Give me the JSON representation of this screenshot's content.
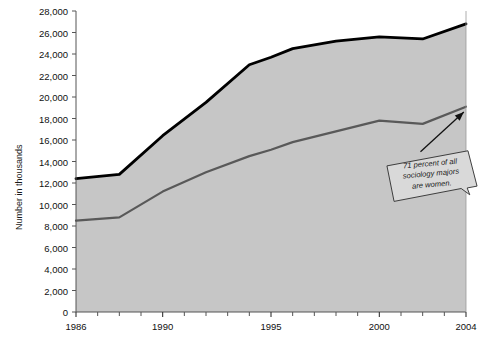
{
  "chart_data": {
    "type": "area",
    "title": "",
    "subtitle": "",
    "xlabel": "",
    "ylabel": "Number in thousands",
    "xlim": [
      1986,
      2004
    ],
    "ylim": [
      0,
      28000
    ],
    "grid": false,
    "legend_position": "inline-labels",
    "stacked": true,
    "x": [
      1986,
      1988,
      1990,
      1992,
      1994,
      1995,
      1996,
      1998,
      2000,
      2002,
      2004
    ],
    "series": [
      {
        "name": "Women",
        "color": "#595959",
        "values": [
          8500,
          8800,
          11200,
          13000,
          14500,
          15100,
          15800,
          16800,
          17800,
          17500,
          19100
        ]
      },
      {
        "name": "Total",
        "color": "#000000",
        "values": [
          12400,
          12800,
          16400,
          19500,
          23000,
          23700,
          24500,
          25200,
          25600,
          25400,
          26800
        ]
      }
    ],
    "ytick_labels": [
      "0",
      "2,000",
      "4,000",
      "6,000",
      "8,000",
      "10,000",
      "12,000",
      "14,000",
      "16,000",
      "18,000",
      "20,000",
      "22,000",
      "24,000",
      "26,000",
      "28,000"
    ],
    "ytick_values": [
      0,
      2000,
      4000,
      6000,
      8000,
      10000,
      12000,
      14000,
      16000,
      18000,
      20000,
      22000,
      24000,
      26000,
      28000
    ],
    "xtick_labels": [
      "1986",
      "1990",
      "1995",
      "2000",
      "2004"
    ],
    "xtick_values": [
      1986,
      1990,
      1995,
      2000,
      2004
    ],
    "xminor_values": [
      1987,
      1988,
      1989,
      1991,
      1992,
      1993,
      1994,
      1996,
      1997,
      1998,
      1999,
      2001,
      2002,
      2003
    ],
    "area_fill_color": "#c6c6c6",
    "inline_labels": [
      {
        "text": "Men",
        "x": 1996.6,
        "y": 19600
      },
      {
        "text": "Women",
        "x": 1995.6,
        "y": 10300
      }
    ],
    "annotation": {
      "lines": [
        "71 percent of all",
        "sociology majors",
        "are women."
      ],
      "arrow_from_x": 2001.9,
      "arrow_from_y": 14900,
      "arrow_to_x": 2003.9,
      "arrow_to_y": 18600
    }
  }
}
